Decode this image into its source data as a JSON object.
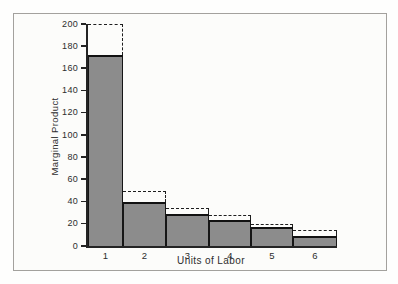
{
  "figure": {
    "background": "#fcfcfa",
    "frame_color": "#a3a19d"
  },
  "chart_data": {
    "type": "bar",
    "title": "",
    "xlabel": "Units of Labor",
    "ylabel": "Marginal Product",
    "categories": [
      "1",
      "2",
      "3",
      "4",
      "5",
      "6"
    ],
    "series": [
      {
        "name": "marginal-product-solid-bars",
        "values": [
          172,
          40,
          29,
          23,
          17,
          9
        ]
      },
      {
        "name": "dashed-step-outline",
        "values": [
          200,
          50,
          34,
          28,
          20,
          14
        ]
      }
    ],
    "ylim": [
      0,
      200
    ],
    "yticks": [
      0,
      20,
      40,
      60,
      80,
      100,
      120,
      140,
      160,
      180,
      200
    ],
    "grid": false,
    "legend": "none",
    "bar_fill": "#8c8c8c",
    "bar_border": "#161616",
    "dash_color": "#1e1e1e",
    "axis_color": "#242424"
  }
}
